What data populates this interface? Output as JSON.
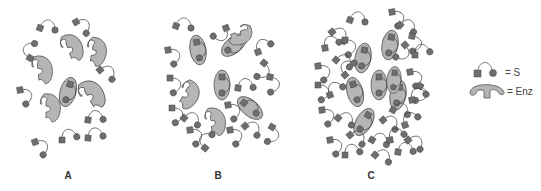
{
  "figure": {
    "panels": [
      {
        "label": "A",
        "description": "Low substrate concentration: most enzymes free",
        "enzymes_free": 5,
        "enzymes_bound": 1,
        "substrates_free": 9
      },
      {
        "label": "B",
        "description": "Intermediate substrate concentration: about half of enzymes bound",
        "enzymes_free": 3,
        "enzymes_bound": 4,
        "substrates_free": 21
      },
      {
        "label": "C",
        "description": "High substrate concentration: all enzymes saturated",
        "enzymes_free": 0,
        "enzymes_bound": 7,
        "substrates_free": 45
      }
    ],
    "legend": {
      "substrate": {
        "symbol": "square-arc-circle",
        "label": "= S"
      },
      "enzyme": {
        "symbol": "enzyme-crescent",
        "label": "= Enz"
      }
    },
    "colors": {
      "enzyme_fill": "#b5b5b5",
      "enzyme_stroke": "#555555",
      "substrate_fill": "#6e6e6e",
      "substrate_stroke": "#4a4a4a",
      "link": "#444444"
    }
  }
}
